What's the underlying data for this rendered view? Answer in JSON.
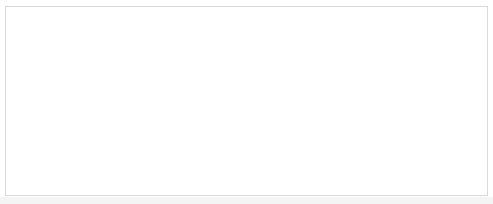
{
  "chart_data": [
    {
      "type": "scatter",
      "title": "C = 0.010000",
      "xlabel": "",
      "ylabel": "",
      "grid": false,
      "legend": {
        "position": "lower left",
        "entries": [
          "0",
          "1"
        ]
      },
      "decision_boundary": {
        "left_y": 97,
        "right_y": 107
      }
    },
    {
      "type": "scatter",
      "title": "C = 1.000000",
      "xlabel": "",
      "ylabel": "",
      "grid": false,
      "decision_boundary": {
        "left_y": 74,
        "right_y": 116
      }
    },
    {
      "type": "scatter",
      "title": "C = 100.000000",
      "xlabel": "",
      "ylabel": "",
      "grid": false,
      "decision_boundary": {
        "left_y": 52,
        "right_y": 139
      }
    }
  ],
  "points": {
    "class_0_circles": [
      [
        16,
        37
      ],
      [
        33,
        75
      ],
      [
        53,
        86
      ],
      [
        23,
        92
      ],
      [
        32,
        93
      ],
      [
        32,
        95
      ],
      [
        19,
        99
      ],
      [
        23,
        106
      ],
      [
        60,
        100
      ],
      [
        66,
        106
      ],
      [
        68,
        109
      ],
      [
        64,
        111
      ],
      [
        107,
        98
      ],
      [
        53,
        133
      ],
      [
        58,
        132
      ],
      [
        93,
        130
      ],
      [
        91,
        135
      ],
      [
        39,
        140
      ]
    ],
    "class_1_triangles": [
      [
        14,
        26
      ],
      [
        22,
        19
      ],
      [
        21,
        26
      ],
      [
        31,
        34
      ],
      [
        44,
        12
      ],
      [
        44,
        19
      ],
      [
        48,
        19
      ],
      [
        52,
        34
      ],
      [
        65,
        29
      ],
      [
        106,
        17
      ],
      [
        116,
        29
      ],
      [
        72,
        75
      ]
    ]
  },
  "colors": {
    "class_0": "#1a1a1a",
    "class_1": "#555555",
    "line": "#1a1a1a",
    "axes": "#555555"
  },
  "legend": {
    "label_0": "0",
    "label_1": "1"
  }
}
